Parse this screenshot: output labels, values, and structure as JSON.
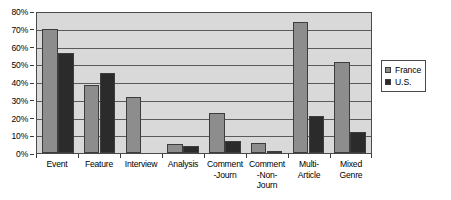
{
  "chart_data": {
    "type": "bar",
    "title": "",
    "xlabel": "",
    "ylabel": "",
    "ylim": [
      0,
      80
    ],
    "y_unit": "%",
    "grid": true,
    "legend_position": "right",
    "categories": [
      "Event",
      "Feature",
      "Interview",
      "Analysis",
      "Comment\n-Journ",
      "Comment\n-Non-\nJourn",
      "Multi-\nArticle",
      "Mixed\nGenre"
    ],
    "y_ticks": [
      "0%",
      "10%",
      "20%",
      "30%",
      "40%",
      "50%",
      "60%",
      "70%",
      "80%"
    ],
    "y_tick_values": [
      0,
      10,
      20,
      30,
      40,
      50,
      60,
      70,
      80
    ],
    "series": [
      {
        "name": "France",
        "color": "#8d8d8d",
        "values": [
          71,
          39,
          32,
          5,
          23,
          6,
          75,
          52
        ]
      },
      {
        "name": "U.S.",
        "color": "#2b2b2b",
        "values": [
          57,
          46,
          0,
          4,
          7,
          1,
          21,
          12
        ]
      }
    ]
  },
  "legend": {
    "items": [
      {
        "label": "France",
        "key": "france"
      },
      {
        "label": "U.S.",
        "key": "us"
      }
    ]
  }
}
